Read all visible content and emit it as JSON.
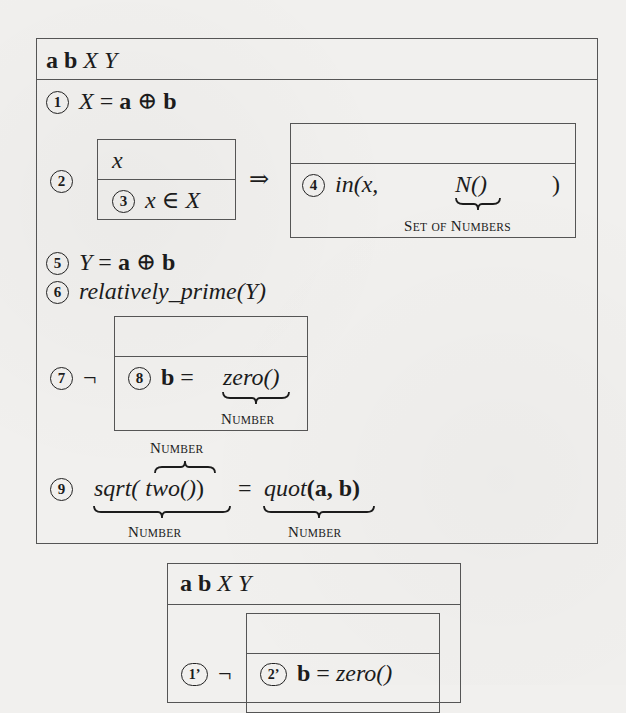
{
  "figure_top": {
    "header": {
      "vars_bold": "a b",
      "vars_italic": "X Y"
    },
    "steps": [
      {
        "num": "1",
        "lhs": "X",
        "op": "=",
        "rhs_a": "a",
        "oplus": "⊕",
        "rhs_b": "b"
      },
      {
        "num": "2",
        "inner_header": "x",
        "inner_step_num": "3",
        "inner_step": "x ∈ X",
        "implies": "⇒"
      },
      {
        "num": "4",
        "func": "in",
        "open": "(x,",
        "arg": "N()",
        "close": ")",
        "arg_label_cap1": "S",
        "arg_label_rest1": "et",
        "arg_label_cap2": "of",
        "arg_label_cap3": "N",
        "arg_label_rest3": "umbers"
      },
      {
        "num": "5",
        "lhs": "Y",
        "op": "=",
        "rhs_a": "a",
        "oplus": "⊕",
        "rhs_b": "b"
      },
      {
        "num": "6",
        "pred": "relatively_prime",
        "arg": "(Y)"
      },
      {
        "num": "7",
        "neg": "¬",
        "inner_step_num": "8",
        "lhs": "b",
        "op": "=",
        "rhs": "zero()",
        "rhs_label_cap": "N",
        "rhs_label_rest": "umber"
      },
      {
        "num": "9",
        "lhs_func": "sqrt(",
        "lhs_inner": "two()",
        "lhs_close": ")",
        "op": "=",
        "rhs_func": "quot",
        "rhs_args": "(a, b)",
        "over_label_cap": "N",
        "over_label_rest": "umber",
        "lhs_label_cap": "N",
        "lhs_label_rest": "umber",
        "rhs_label_cap": "N",
        "rhs_label_rest": "umber"
      }
    ]
  },
  "figure_bottom": {
    "header": {
      "vars_bold": "a b",
      "vars_italic": "X Y"
    },
    "steps": [
      {
        "num": "1’",
        "neg": "¬",
        "inner_step_num": "2’",
        "lhs": "b",
        "op": "=",
        "rhs": "zero()"
      }
    ]
  }
}
